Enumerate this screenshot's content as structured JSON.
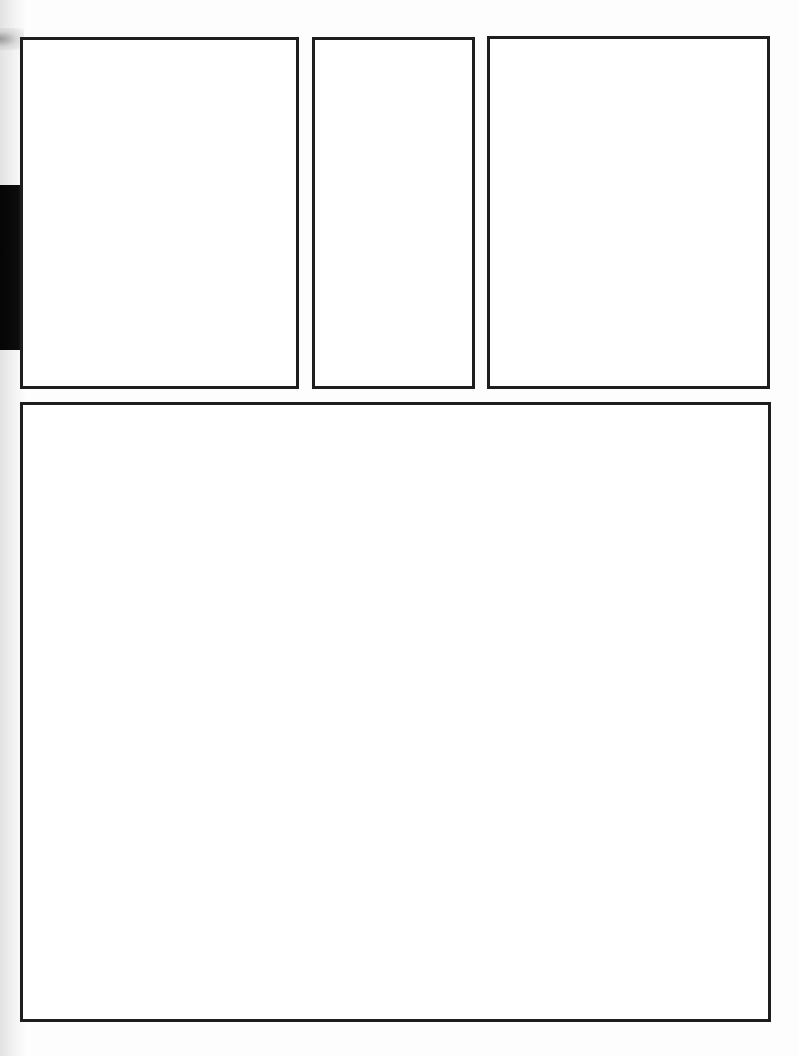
{
  "page": {
    "type": "blank comic page panel template",
    "background": "#fdfdfd",
    "border_color": "#1e1e1e"
  },
  "panels": [
    {
      "id": "panel-1",
      "x": 20,
      "y": 37,
      "width": 279,
      "height": 352,
      "content": ""
    },
    {
      "id": "panel-2",
      "x": 312,
      "y": 37,
      "width": 163,
      "height": 352,
      "content": ""
    },
    {
      "id": "panel-3",
      "x": 487,
      "y": 36,
      "width": 283,
      "height": 353,
      "content": ""
    },
    {
      "id": "panel-4",
      "x": 20,
      "y": 402,
      "width": 751,
      "height": 620,
      "content": ""
    }
  ]
}
